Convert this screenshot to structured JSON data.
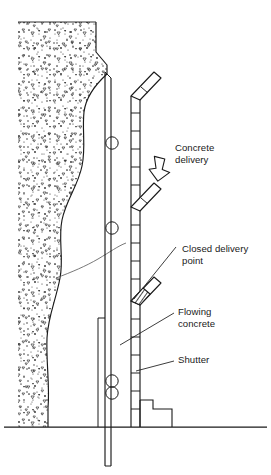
{
  "diagram": {
    "background_color": "#ffffff",
    "line_color": "#1a1a1a",
    "aggregate_color": "#2b2b2b",
    "labels": [
      {
        "id": "concrete-delivery",
        "line1": "Concrete",
        "line2": "delivery",
        "x": 175,
        "y": 151
      },
      {
        "id": "closed-delivery-point",
        "line1": "Closed delivery",
        "line2": "point",
        "x": 182,
        "y": 252
      },
      {
        "id": "flowing-concrete",
        "line1": "Flowing",
        "line2": "concrete",
        "x": 178,
        "y": 315
      },
      {
        "id": "shutter",
        "line1": "Shutter",
        "line2": "",
        "x": 178,
        "y": 363
      }
    ],
    "icons": {
      "delivery_arrow": "arrow-down-left-icon"
    },
    "elements": {
      "concrete_mass": "placed-concrete-mass",
      "shutter_form": "shutter-formwork",
      "delivery_pipe": "segmented-delivery-pipe",
      "ground_line": "ground-line",
      "flow_surface": "flowing-concrete-surface",
      "form_ties": "form-tie-circles",
      "branch_open_upper": "open-delivery-branch-upper",
      "branch_open_middle": "open-delivery-branch-middle",
      "branch_closed_lower": "closed-delivery-branch-lower",
      "base_kicker": "base-kicker-block"
    },
    "counts": {
      "delivery_branches": 3,
      "open_branches": 2,
      "closed_branches": 1,
      "form_ties": 4
    }
  }
}
